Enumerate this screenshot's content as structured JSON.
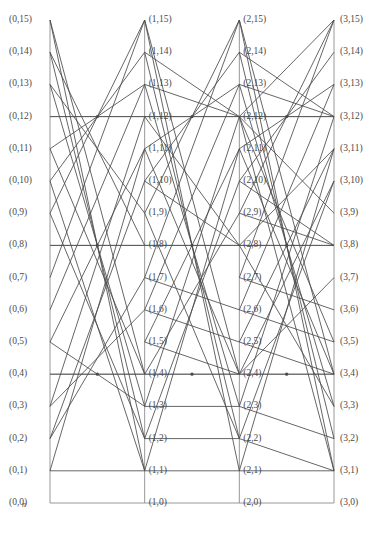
{
  "figure": {
    "kind": "butterfly-network-diagram",
    "width": 379,
    "height": 536,
    "axis_label": "n",
    "stage_count": 4,
    "level_count": 16,
    "stages": [
      0,
      1,
      2,
      3
    ],
    "levels": [
      0,
      1,
      2,
      3,
      4,
      5,
      6,
      7,
      8,
      9,
      10,
      11,
      12,
      13,
      14,
      15
    ],
    "colors": {
      "edge": "#4a4a4a",
      "frame": "#8c8c8c",
      "label": "#4a4a4a",
      "background": "#ffffff"
    },
    "geometry": {
      "column_x": [
        50,
        146,
        240,
        334
      ],
      "baseline_y": 503,
      "top_y": 20,
      "row_step": 32.2
    },
    "labels": [
      "(0,0)",
      "(0,1)",
      "(0,2)",
      "(0,3)",
      "(0,4)",
      "(0,5)",
      "(0,6)",
      "(0,7)",
      "(0,8)",
      "(0,9)",
      "(0,10)",
      "(0,11)",
      "(0,12)",
      "(0,13)",
      "(0,14)",
      "(0,15)",
      "(1,0)",
      "(1,1)",
      "(1,2)",
      "(1,3)",
      "(1,4)",
      "(1,5)",
      "(1,6)",
      "(1,7)",
      "(1,8)",
      "(1,9)",
      "(1,10)",
      "(1,11)",
      "(1,12)",
      "(1,13)",
      "(1,14)",
      "(1,15)",
      "(2,0)",
      "(2,1)",
      "(2,2)",
      "(2,3)",
      "(2,4)",
      "(2,5)",
      "(2,6)",
      "(2,7)",
      "(2,8)",
      "(2,9)",
      "(2,10)",
      "(2,11)",
      "(2,12)",
      "(2,13)",
      "(2,14)",
      "(2,15)",
      "(3,0)",
      "(3,1)",
      "(3,2)",
      "(3,3)",
      "(3,4)",
      "(3,5)",
      "(3,6)",
      "(3,7)",
      "(3,8)",
      "(3,9)",
      "(3,10)",
      "(3,11)",
      "(3,12)",
      "(3,13)",
      "(3,14)",
      "(3,15)"
    ],
    "frame_lines": {
      "verticals": [
        {
          "stage": 0,
          "from_level": 0,
          "to_level": 15
        },
        {
          "stage": 1,
          "from_level": 0,
          "to_level": 15
        },
        {
          "stage": 2,
          "from_level": 0,
          "to_level": 15
        },
        {
          "stage": 3,
          "from_level": 0,
          "to_level": 15
        }
      ],
      "horizontals": [
        {
          "level": 0,
          "from_stage": 0,
          "to_stage": 3
        },
        {
          "level": 4,
          "from_stage": 0,
          "to_stage": 3
        },
        {
          "level": 8,
          "from_stage": 0,
          "to_stage": 3
        },
        {
          "level": 12,
          "from_stage": 0,
          "to_stage": 3
        }
      ]
    },
    "edges": [
      {
        "s0": 0,
        "l0": 15,
        "s1": 1,
        "l1": 4
      },
      {
        "s0": 0,
        "l0": 15,
        "s1": 1,
        "l1": 1
      },
      {
        "s0": 0,
        "l0": 14,
        "s1": 1,
        "l1": 2
      },
      {
        "s0": 0,
        "l0": 14,
        "s1": 1,
        "l1": 8
      },
      {
        "s0": 0,
        "l0": 13,
        "s1": 1,
        "l1": 3
      },
      {
        "s0": 0,
        "l0": 13,
        "s1": 1,
        "l1": 9
      },
      {
        "s0": 0,
        "l0": 12,
        "s1": 1,
        "l1": 12
      },
      {
        "s0": 0,
        "l0": 11,
        "s1": 1,
        "l1": 4
      },
      {
        "s0": 0,
        "l0": 11,
        "s1": 1,
        "l1": 13
      },
      {
        "s0": 0,
        "l0": 10,
        "s1": 1,
        "l1": 1
      },
      {
        "s0": 0,
        "l0": 10,
        "s1": 1,
        "l1": 14
      },
      {
        "s0": 0,
        "l0": 9,
        "s1": 1,
        "l1": 2
      },
      {
        "s0": 0,
        "l0": 9,
        "s1": 1,
        "l1": 15
      },
      {
        "s0": 0,
        "l0": 8,
        "s1": 1,
        "l1": 8
      },
      {
        "s0": 0,
        "l0": 7,
        "s1": 1,
        "l1": 15
      },
      {
        "s0": 0,
        "l0": 6,
        "s1": 1,
        "l1": 13
      },
      {
        "s0": 0,
        "l0": 5,
        "s1": 1,
        "l1": 3
      },
      {
        "s0": 0,
        "l0": 5,
        "s1": 1,
        "l1": 11
      },
      {
        "s0": 0,
        "l0": 4,
        "s1": 1,
        "l1": 4
      },
      {
        "s0": 0,
        "l0": 3,
        "s1": 1,
        "l1": 12
      },
      {
        "s0": 0,
        "l0": 3,
        "s1": 1,
        "l1": 6
      },
      {
        "s0": 0,
        "l0": 2,
        "s1": 1,
        "l1": 10
      },
      {
        "s0": 0,
        "l0": 2,
        "s1": 1,
        "l1": 7
      },
      {
        "s0": 0,
        "l0": 1,
        "s1": 1,
        "l1": 11
      },
      {
        "s0": 0,
        "l0": 1,
        "s1": 1,
        "l1": 1
      },
      {
        "s0": 1,
        "l0": 15,
        "s1": 2,
        "l1": 4
      },
      {
        "s0": 1,
        "l0": 15,
        "s1": 2,
        "l1": 1
      },
      {
        "s0": 1,
        "l0": 14,
        "s1": 2,
        "l1": 2
      },
      {
        "s0": 1,
        "l0": 14,
        "s1": 2,
        "l1": 12
      },
      {
        "s0": 1,
        "l0": 13,
        "s1": 2,
        "l1": 3
      },
      {
        "s0": 1,
        "l0": 13,
        "s1": 2,
        "l1": 12
      },
      {
        "s0": 1,
        "l0": 12,
        "s1": 2,
        "l1": 12
      },
      {
        "s0": 1,
        "l0": 12,
        "s1": 2,
        "l1": 8
      },
      {
        "s0": 1,
        "l0": 11,
        "s1": 2,
        "l1": 13
      },
      {
        "s0": 1,
        "l0": 11,
        "s1": 2,
        "l1": 4
      },
      {
        "s0": 1,
        "l0": 10,
        "s1": 2,
        "l1": 14
      },
      {
        "s0": 1,
        "l0": 10,
        "s1": 2,
        "l1": 8
      },
      {
        "s0": 1,
        "l0": 9,
        "s1": 2,
        "l1": 15
      },
      {
        "s0": 1,
        "l0": 9,
        "s1": 2,
        "l1": 2
      },
      {
        "s0": 1,
        "l0": 8,
        "s1": 2,
        "l1": 8
      },
      {
        "s0": 1,
        "l0": 7,
        "s1": 2,
        "l1": 15
      },
      {
        "s0": 1,
        "l0": 7,
        "s1": 2,
        "l1": 6
      },
      {
        "s0": 1,
        "l0": 6,
        "s1": 2,
        "l1": 13
      },
      {
        "s0": 1,
        "l0": 6,
        "s1": 2,
        "l1": 5
      },
      {
        "s0": 1,
        "l0": 5,
        "s1": 2,
        "l1": 11
      },
      {
        "s0": 1,
        "l0": 5,
        "s1": 2,
        "l1": 4
      },
      {
        "s0": 1,
        "l0": 4,
        "s1": 2,
        "l1": 4
      },
      {
        "s0": 1,
        "l0": 4,
        "s1": 2,
        "l1": 9
      },
      {
        "s0": 1,
        "l0": 3,
        "s1": 2,
        "l1": 12
      },
      {
        "s0": 1,
        "l0": 3,
        "s1": 2,
        "l1": 3
      },
      {
        "s0": 1,
        "l0": 2,
        "s1": 2,
        "l1": 10
      },
      {
        "s0": 1,
        "l0": 2,
        "s1": 2,
        "l1": 2
      },
      {
        "s0": 1,
        "l0": 1,
        "s1": 2,
        "l1": 11
      },
      {
        "s0": 1,
        "l0": 1,
        "s1": 2,
        "l1": 1
      },
      {
        "s0": 2,
        "l0": 15,
        "s1": 3,
        "l1": 4
      },
      {
        "s0": 2,
        "l0": 15,
        "s1": 3,
        "l1": 1
      },
      {
        "s0": 2,
        "l0": 14,
        "s1": 3,
        "l1": 12
      },
      {
        "s0": 2,
        "l0": 14,
        "s1": 3,
        "l1": 2
      },
      {
        "s0": 2,
        "l0": 13,
        "s1": 3,
        "l1": 12
      },
      {
        "s0": 2,
        "l0": 13,
        "s1": 3,
        "l1": 3
      },
      {
        "s0": 2,
        "l0": 12,
        "s1": 3,
        "l1": 12
      },
      {
        "s0": 2,
        "l0": 12,
        "s1": 3,
        "l1": 15
      },
      {
        "s0": 2,
        "l0": 12,
        "s1": 3,
        "l1": 9
      },
      {
        "s0": 2,
        "l0": 12,
        "s1": 3,
        "l1": 5
      },
      {
        "s0": 2,
        "l0": 12,
        "s1": 3,
        "l1": 1
      },
      {
        "s0": 2,
        "l0": 11,
        "s1": 3,
        "l1": 13
      },
      {
        "s0": 2,
        "l0": 11,
        "s1": 3,
        "l1": 4
      },
      {
        "s0": 2,
        "l0": 10,
        "s1": 3,
        "l1": 14
      },
      {
        "s0": 2,
        "l0": 10,
        "s1": 3,
        "l1": 8
      },
      {
        "s0": 2,
        "l0": 9,
        "s1": 3,
        "l1": 15
      },
      {
        "s0": 2,
        "l0": 9,
        "s1": 3,
        "l1": 8
      },
      {
        "s0": 2,
        "l0": 8,
        "s1": 3,
        "l1": 8
      },
      {
        "s0": 2,
        "l0": 8,
        "s1": 3,
        "l1": 11
      },
      {
        "s0": 2,
        "l0": 8,
        "s1": 3,
        "l1": 3
      },
      {
        "s0": 2,
        "l0": 7,
        "s1": 3,
        "l1": 15
      },
      {
        "s0": 2,
        "l0": 7,
        "s1": 3,
        "l1": 6
      },
      {
        "s0": 2,
        "l0": 6,
        "s1": 3,
        "l1": 13
      },
      {
        "s0": 2,
        "l0": 6,
        "s1": 3,
        "l1": 5
      },
      {
        "s0": 2,
        "l0": 5,
        "s1": 3,
        "l1": 11
      },
      {
        "s0": 2,
        "l0": 5,
        "s1": 3,
        "l1": 4
      },
      {
        "s0": 2,
        "l0": 4,
        "s1": 3,
        "l1": 4
      },
      {
        "s0": 2,
        "l0": 4,
        "s1": 3,
        "l1": 7
      },
      {
        "s0": 2,
        "l0": 4,
        "s1": 3,
        "l1": 10
      },
      {
        "s0": 2,
        "l0": 3,
        "s1": 3,
        "l1": 12
      },
      {
        "s0": 2,
        "l0": 3,
        "s1": 3,
        "l1": 2
      },
      {
        "s0": 2,
        "l0": 2,
        "s1": 3,
        "l1": 10
      },
      {
        "s0": 2,
        "l0": 2,
        "s1": 3,
        "l1": 1
      },
      {
        "s0": 2,
        "l0": 1,
        "s1": 3,
        "l1": 11
      },
      {
        "s0": 2,
        "l0": 1,
        "s1": 3,
        "l1": 1
      }
    ],
    "hub_nodes": [
      {
        "stage_fraction": 0.5,
        "level": 12
      },
      {
        "stage_fraction": 0.5,
        "level": 8
      },
      {
        "stage_fraction": 0.5,
        "level": 4
      },
      {
        "stage_fraction": 1.5,
        "level": 12
      },
      {
        "stage_fraction": 1.5,
        "level": 8
      },
      {
        "stage_fraction": 1.5,
        "level": 4
      },
      {
        "stage_fraction": 2.5,
        "level": 12
      },
      {
        "stage_fraction": 2.5,
        "level": 8
      },
      {
        "stage_fraction": 2.5,
        "level": 4
      }
    ]
  }
}
